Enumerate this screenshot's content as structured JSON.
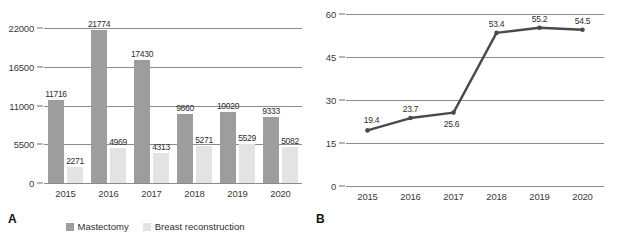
{
  "figure": {
    "panel_a_letter": "A",
    "panel_b_letter": "B",
    "colors": {
      "mastectomy_bar": "#9d9d9d",
      "reconstruction_bar": "#e3e3e3",
      "line": "#4a4a4a",
      "gridline": "#8b8b8b",
      "text": "#2d2d2d"
    }
  },
  "legend": {
    "items": [
      {
        "label": "Mastectomy",
        "color": "#9d9d9d",
        "swatch_name": "legend-swatch-mastectomy"
      },
      {
        "label": "Breast reconstruction",
        "color": "#e3e3e3",
        "swatch_name": "legend-swatch-reconstruction"
      }
    ]
  },
  "chart_data": [
    {
      "panel": "A",
      "type": "bar",
      "title": "",
      "xlabel": "",
      "ylabel": "",
      "categories": [
        "2015",
        "2016",
        "2017",
        "2018",
        "2019",
        "2020"
      ],
      "yticks": [
        0,
        5500,
        11000,
        16500,
        22000
      ],
      "ytick_labels": [
        "0",
        "5500",
        "11000",
        "16500",
        "22000"
      ],
      "ylim": [
        0,
        22000
      ],
      "grid": true,
      "legend_position": "bottom-center",
      "series": [
        {
          "name": "Mastectomy",
          "color": "#9d9d9d",
          "values": [
            11716,
            21774,
            17430,
            9860,
            10020,
            9333
          ],
          "labels": [
            "11716",
            "21774",
            "17430",
            "9860",
            "10020",
            "9333"
          ]
        },
        {
          "name": "Breast reconstruction",
          "color": "#e3e3e3",
          "values": [
            2271,
            4969,
            4313,
            5271,
            5529,
            5082
          ],
          "labels": [
            "2271",
            "4969",
            "4313",
            "5271",
            "5529",
            "5082"
          ]
        }
      ]
    },
    {
      "panel": "B",
      "type": "line",
      "title": "",
      "xlabel": "",
      "ylabel": "",
      "categories": [
        "2015",
        "2016",
        "2017",
        "2018",
        "2019",
        "2020"
      ],
      "yticks": [
        0,
        15,
        30,
        45,
        60
      ],
      "ytick_labels": [
        "0",
        "15",
        "30",
        "45",
        "60"
      ],
      "ylim": [
        0,
        60
      ],
      "grid": true,
      "legend_position": "none",
      "series": [
        {
          "name": "Reconstruction rate",
          "color": "#4a4a4a",
          "values": [
            19.4,
            23.7,
            25.6,
            53.4,
            55.2,
            54.5
          ],
          "labels": [
            "19.4",
            "23.7",
            "25.6",
            "53.4",
            "55.2",
            "54.5"
          ]
        }
      ]
    }
  ]
}
